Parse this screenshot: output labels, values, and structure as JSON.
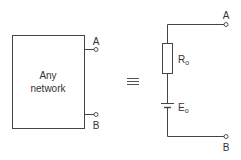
{
  "diagram": {
    "network_box": {
      "label_line1": "Any",
      "label_line2": "network"
    },
    "terminals": {
      "a": "A",
      "b": "B"
    },
    "equivalence_symbol": "≡",
    "equivalent_circuit": {
      "resistor_label": "R",
      "resistor_subscript": "o",
      "source_label": "E",
      "source_subscript": "o",
      "terminal_a": "A",
      "terminal_b": "B"
    },
    "colors": {
      "stroke": "#444444",
      "text": "#333333"
    }
  }
}
